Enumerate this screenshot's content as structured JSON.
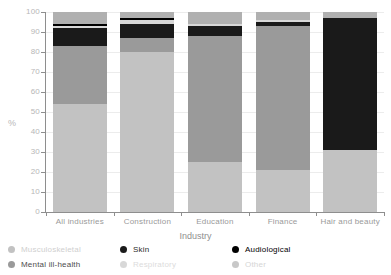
{
  "chart_data": {
    "type": "bar",
    "subtype": "stacked-bar-100-percent",
    "title": "",
    "xlabel": "Industry",
    "ylabel": "%",
    "ylim": [
      0,
      100
    ],
    "ytick_step": 10,
    "yticks": [
      "100",
      "90",
      "80",
      "70",
      "60",
      "50",
      "40",
      "30",
      "20",
      "10",
      "0"
    ],
    "grid": true,
    "legend_position": "bottom",
    "categories": [
      "All industries",
      "Construction",
      "Education",
      "Finance",
      "Hair and beauty"
    ],
    "series": [
      {
        "name": "Musculoskeletal",
        "color": "#c2c2c2",
        "values": [
          54,
          80,
          25,
          21,
          31
        ]
      },
      {
        "name": "Mental ill-health",
        "color": "#9a9a9a",
        "values": [
          29,
          7,
          63,
          72,
          0
        ]
      },
      {
        "name": "Skin",
        "color": "#1a1a1a",
        "values": [
          9,
          7,
          5,
          2,
          66
        ]
      },
      {
        "name": "Respiratory",
        "color": "#d8d8d8",
        "values": [
          1,
          2,
          1,
          1,
          0
        ]
      },
      {
        "name": "Audiological",
        "color": "#000000",
        "values": [
          1,
          1,
          0,
          0,
          0
        ]
      },
      {
        "name": "Other",
        "color": "#b0b0b0",
        "values": [
          6,
          3,
          6,
          4,
          3
        ]
      }
    ]
  },
  "axis": {
    "y_title": "%",
    "x_title": "Industry"
  },
  "legend": {
    "entries": [
      {
        "label": "Musculoskeletal",
        "color": "#c2c2c2",
        "text_color": "#cfcfcf"
      },
      {
        "label": "Mental ill-health",
        "color": "#9a9a9a",
        "text_color": "#4d4d4d"
      },
      {
        "label": "Skin",
        "color": "#1a1a1a",
        "text_color": "#2b2b2b"
      },
      {
        "label": "Respiratory",
        "color": "#d8d8d8",
        "text_color": "#dcdcdc"
      },
      {
        "label": "Audiological",
        "color": "#000000",
        "text_color": "#000000"
      },
      {
        "label": "Other",
        "color": "#c8c8c8",
        "text_color": "#d5d5d5"
      }
    ]
  }
}
